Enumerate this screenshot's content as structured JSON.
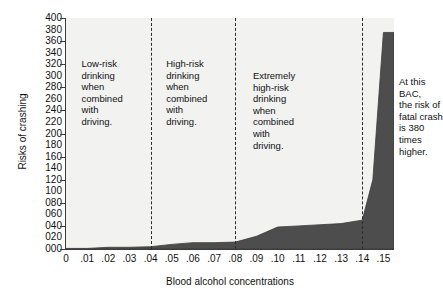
{
  "chart_data": {
    "type": "area",
    "title": "",
    "xlabel": "Blood alcohol concentrations",
    "ylabel": "Risks of crashing",
    "xlim": [
      0,
      0.155
    ],
    "ylim": [
      0,
      400
    ],
    "grid": false,
    "legend": "none",
    "x_tick_labels": [
      "0",
      ".01",
      ".02",
      ".03",
      ".04",
      ".05",
      ".06",
      ".07",
      ".08",
      ".09",
      ".10",
      ".11",
      ".12",
      ".13",
      ".14",
      ".15"
    ],
    "x_tick_values": [
      0,
      0.01,
      0.02,
      0.03,
      0.04,
      0.05,
      0.06,
      0.07,
      0.08,
      0.09,
      0.1,
      0.11,
      0.12,
      0.13,
      0.14,
      0.15
    ],
    "x_major_ticks": [
      0,
      0.02,
      0.04,
      0.06,
      0.08,
      0.1,
      0.12,
      0.14
    ],
    "y_tick_labels": [
      "400",
      "380",
      "360",
      "340",
      "320",
      "300",
      "280",
      "260",
      "240",
      "220",
      "200",
      "180",
      "160",
      "140",
      "120",
      "100",
      "080",
      "060",
      "040",
      "020",
      "000"
    ],
    "y_tick_values": [
      400,
      380,
      360,
      340,
      320,
      300,
      280,
      260,
      240,
      220,
      200,
      180,
      160,
      140,
      120,
      100,
      80,
      60,
      40,
      20,
      0
    ],
    "y_major_ticks": [
      0,
      40,
      80,
      120,
      160,
      200,
      240,
      280,
      320,
      360,
      400
    ],
    "series": [
      {
        "name": "Risk of crashing",
        "x": [
          0,
          0.01,
          0.02,
          0.03,
          0.04,
          0.05,
          0.06,
          0.07,
          0.08,
          0.09,
          0.1,
          0.11,
          0.12,
          0.13,
          0.14,
          0.145,
          0.15
        ],
        "values": [
          1,
          1,
          3,
          3,
          4,
          8,
          11,
          11,
          12,
          22,
          38,
          40,
          42,
          44,
          50,
          120,
          375
        ],
        "area_color": "#4d4d4d",
        "background_color": "#f2f2f1"
      }
    ],
    "dividers": [
      0.04,
      0.08,
      0.14
    ],
    "annotations": [
      {
        "name": "low-risk",
        "x": 0.043,
        "text": "Low-risk\ndrinking\nwhen\ncombined\nwith\ndriving."
      },
      {
        "name": "high-risk",
        "x": 0.083,
        "text": "High-risk\ndrinking\nwhen\ncombined\nwith\ndriving."
      },
      {
        "name": "extreme-risk",
        "x": 0.103,
        "text": "Extremely\nhigh-risk\ndrinking\nwhen\ncombined\nwith\ndriving."
      },
      {
        "name": "bac-callout",
        "x": 0.157,
        "text": "At this BAC,\nthe risk of\nfatal crash\nis 380 times\nhigher."
      }
    ]
  },
  "labels": {
    "y_axis_title": "Risks of crashing",
    "x_axis_title": "Blood alcohol concentrations",
    "band_low_risk": "Low-risk\ndrinking\nwhen\ncombined\nwith\ndriving.",
    "band_high_risk": "High-risk\ndrinking\nwhen\ncombined\nwith\ndriving.",
    "band_extreme_risk": "Extremely\nhigh-risk\ndrinking\nwhen\ncombined\nwith\ndriving.",
    "bac_callout": "At this BAC,\nthe risk of\nfatal crash\nis 380 times\nhigher."
  },
  "colors": {
    "area_fill": "#4d4d4d",
    "plot_background": "#f2f2f1",
    "axis": "#3b3b3b",
    "text": "#111111",
    "divider": "#2a2a2a"
  }
}
